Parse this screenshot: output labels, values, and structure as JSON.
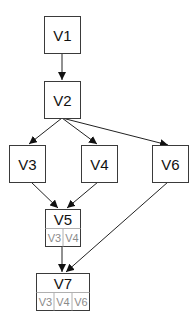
{
  "diagram": {
    "type": "directed-graph",
    "nodes": {
      "v1": {
        "label": "V1"
      },
      "v2": {
        "label": "V2"
      },
      "v3": {
        "label": "V3"
      },
      "v4": {
        "label": "V4"
      },
      "v5": {
        "label": "V5",
        "sub": [
          "V3",
          "V4"
        ]
      },
      "v6": {
        "label": "V6"
      },
      "v7": {
        "label": "V7",
        "sub": [
          "V3",
          "V4",
          "V6"
        ]
      }
    },
    "edges": [
      {
        "from": "V1",
        "to": "V2"
      },
      {
        "from": "V2",
        "to": "V3"
      },
      {
        "from": "V2",
        "to": "V4"
      },
      {
        "from": "V2",
        "to": "V6"
      },
      {
        "from": "V3",
        "to": "V5"
      },
      {
        "from": "V4",
        "to": "V5"
      },
      {
        "from": "V5",
        "to": "V7"
      },
      {
        "from": "V6",
        "to": "V7"
      }
    ],
    "colors": {
      "border": "#3a3a3a",
      "edge": "#222222",
      "sub_text": "#8a8a8a"
    }
  }
}
